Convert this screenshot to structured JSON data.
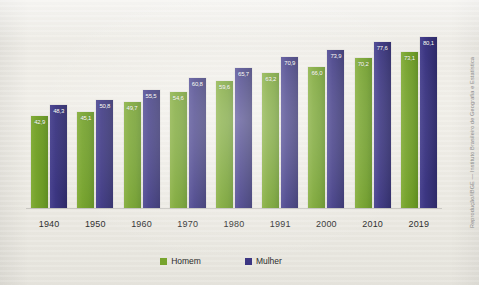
{
  "chart_data": {
    "type": "bar",
    "title": "",
    "xlabel": "",
    "ylabel": "",
    "ylim": [
      0,
      90
    ],
    "grid": false,
    "legend_position": "bottom",
    "categories": [
      "1940",
      "1950",
      "1960",
      "1970",
      "1980",
      "1991",
      "2000",
      "2010",
      "2019"
    ],
    "series": [
      {
        "name": "Homem",
        "color": "#77a42d",
        "values": [
          42.9,
          45.1,
          49.7,
          54.6,
          59.6,
          63.2,
          66.0,
          70.2,
          73.1
        ],
        "labels": [
          "42,9",
          "45,1",
          "49,7",
          "54,6",
          "59,6",
          "63,2",
          "66,0",
          "70,2",
          "73,1"
        ]
      },
      {
        "name": "Mulher",
        "color": "#3b3582",
        "values": [
          48.3,
          50.8,
          55.5,
          60.8,
          65.7,
          70.9,
          73.9,
          77.6,
          80.1
        ],
        "labels": [
          "48,3",
          "50,8",
          "55,5",
          "60,8",
          "65,7",
          "70,9",
          "73,9",
          "77,6",
          "80,1"
        ]
      }
    ]
  },
  "legend": {
    "items": [
      {
        "label": "Homem",
        "color": "#77a42d"
      },
      {
        "label": "Mulher",
        "color": "#3b3582"
      }
    ]
  },
  "credit": {
    "text": "Reprodução/IBGE — Instituto Brasileiro de Geografia e Estatística"
  }
}
